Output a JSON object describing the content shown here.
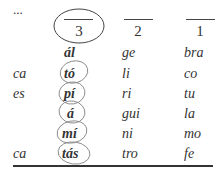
{
  "table": {
    "headers": [
      "...",
      "3",
      "2",
      "1"
    ],
    "rows": [
      [
        "",
        "ál",
        "ge",
        "bra"
      ],
      [
        "ca",
        "tó",
        "li",
        "co"
      ],
      [
        "es",
        "pí",
        "ri",
        "tu"
      ],
      [
        "",
        "á",
        "gui",
        "la"
      ],
      [
        "",
        "mí",
        "ni",
        "mo"
      ],
      [
        "ca",
        "tás",
        "tro",
        "fe"
      ]
    ],
    "circled_header": "3",
    "circled_cells_column": "3",
    "circled_rows": [
      1,
      2,
      3,
      4,
      5
    ]
  }
}
